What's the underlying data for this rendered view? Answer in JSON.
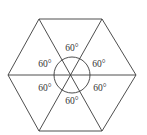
{
  "diagram": {
    "shape": "hexagon",
    "vertices": [
      [
        39,
        19
      ],
      [
        102,
        19
      ],
      [
        136,
        75
      ],
      [
        102,
        131
      ],
      [
        39,
        131
      ],
      [
        8,
        75
      ]
    ],
    "center": [
      72,
      75
    ],
    "angle_circle_radius": 18,
    "angle_labels": [
      {
        "text": "60°",
        "x": 72,
        "y": 51
      },
      {
        "text": "60°",
        "x": 99,
        "y": 67
      },
      {
        "text": "60°",
        "x": 100,
        "y": 91
      },
      {
        "text": "60°",
        "x": 72,
        "y": 104
      },
      {
        "text": "60°",
        "x": 45,
        "y": 91
      },
      {
        "text": "60°",
        "x": 45,
        "y": 67
      }
    ],
    "colors": {
      "stroke": "#3a3a3a",
      "text": "#333333",
      "background": "#ffffff"
    }
  }
}
